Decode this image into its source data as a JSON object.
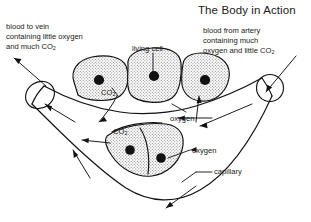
{
  "figure": {
    "title": "The Body in Action",
    "background_color": "#ffffff",
    "ink_color": "#111111",
    "cell_fill_color": "#d9d9d9",
    "nucleus_color": "#111111"
  },
  "labels": {
    "blood_to_vein": {
      "line1": "blood to vein",
      "line2": "containing little oxygen",
      "line3_pre": "and much CO",
      "line3_sub": "2"
    },
    "blood_from_artery": {
      "line1": "blood from artery",
      "line2": "containing much",
      "line3_pre": "oxygen and little CO",
      "line3_sub": "2"
    },
    "living_cell": "living cell",
    "co2_upper_pre": "CO",
    "co2_upper_sub": "2",
    "co2_lower_pre": "CO",
    "co2_lower_sub": "2",
    "oxygen_upper": "oxygen",
    "oxygen_lower": "oxygen",
    "capillary": "capillary"
  },
  "diagram_parts": {
    "vessel": "capillary-v-shaped-tube",
    "vein_end": "left-cut-vessel-ellipse",
    "artery_end": "right-cut-vessel-circle",
    "upper_cells": 3,
    "lower_cells": 2,
    "flow_arrows": "blood-flow-and-gas-exchange-arrows"
  }
}
